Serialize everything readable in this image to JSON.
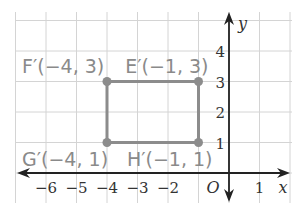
{
  "figure": {
    "type": "coordinate-plane",
    "axes": {
      "x_label": "x",
      "y_label": "y",
      "origin_label": "O",
      "x_ticks": [
        {
          "value": -6,
          "label": "−6"
        },
        {
          "value": -5,
          "label": "−5"
        },
        {
          "value": -4,
          "label": "−4"
        },
        {
          "value": -3,
          "label": "−3"
        },
        {
          "value": -2,
          "label": "−2"
        },
        {
          "value": 1,
          "label": "1"
        }
      ],
      "y_ticks": [
        {
          "value": 1,
          "label": "1"
        },
        {
          "value": 2,
          "label": "2"
        },
        {
          "value": 3,
          "label": "3"
        },
        {
          "value": 4,
          "label": "4"
        }
      ],
      "x_range": [
        -7,
        2
      ],
      "y_range": [
        -1,
        5
      ],
      "grid": true
    },
    "shape": {
      "name": "rectangle",
      "stroke_color": "#8c8c8c",
      "vertices": [
        {
          "name": "F'",
          "x": -4,
          "y": 3,
          "label": "F′(−4, 3)"
        },
        {
          "name": "E'",
          "x": -1,
          "y": 3,
          "label": "E′(−1, 3)"
        },
        {
          "name": "H'",
          "x": -1,
          "y": 1,
          "label": "H′(−1, 1)"
        },
        {
          "name": "G'",
          "x": -4,
          "y": 1,
          "label": "G′(−4, 1)"
        }
      ]
    },
    "colors": {
      "grid": "#d4d4d4",
      "axis": "#222222",
      "shape": "#8c8c8c",
      "label": "#8a8a8a"
    }
  }
}
